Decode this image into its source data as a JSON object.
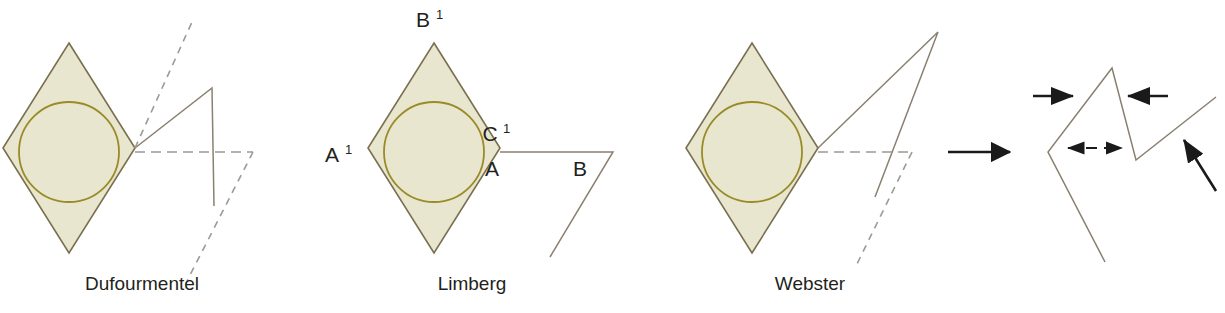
{
  "figure": {
    "background_color": "#ffffff"
  },
  "colors": {
    "lesion_fill": "#e8e6cf",
    "lesion_stroke": "#9a8b28",
    "rhombus_stroke": "#7a6f4e",
    "flap_line": "#8a8070",
    "dashed_line": "#9b9a93",
    "arrow": "#1a1a1a",
    "text": "#231f20"
  },
  "panels": [
    {
      "id": "dufourmentel",
      "caption": "Dufourmentel",
      "caption_x": 142,
      "caption_y": 290,
      "rhombus": {
        "cx": 69,
        "cy": 148,
        "rx": 66,
        "ry": 105
      },
      "circle": {
        "cx": 69,
        "cy": 152,
        "r": 50
      }
    },
    {
      "id": "limberg",
      "caption": "Limberg",
      "caption_x": 472,
      "caption_y": 290,
      "rhombus": {
        "cx": 434,
        "cy": 148,
        "rx": 66,
        "ry": 105
      },
      "circle": {
        "cx": 434,
        "cy": 152,
        "r": 50
      },
      "vertex_labels": [
        {
          "name": "B-prime",
          "text": "B",
          "sup": "1",
          "x": 423,
          "y": 27
        },
        {
          "name": "A-prime",
          "text": "A",
          "sup": "1",
          "x": 332,
          "y": 162
        },
        {
          "name": "C-prime",
          "text": "C",
          "sup": "1",
          "x": 490,
          "y": 141
        },
        {
          "name": "A",
          "text": "A",
          "sup": "",
          "x": 492,
          "y": 176
        },
        {
          "name": "B",
          "text": "B",
          "sup": "",
          "x": 580,
          "y": 176
        }
      ]
    },
    {
      "id": "webster",
      "caption": "Webster",
      "caption_x": 810,
      "caption_y": 290,
      "rhombus": {
        "cx": 752,
        "cy": 148,
        "rx": 66,
        "ry": 105
      },
      "circle": {
        "cx": 752,
        "cy": 152,
        "r": 50
      }
    },
    {
      "id": "closure",
      "caption": "",
      "caption_x": 0,
      "caption_y": 0
    }
  ],
  "arrows": [
    {
      "name": "transition-arrow",
      "direction": "right",
      "style": "solid",
      "x1": 948,
      "y1": 152,
      "x2": 1014,
      "y2": 152
    },
    {
      "name": "closure-arrow-left-top",
      "direction": "right",
      "style": "solid",
      "x1": 1033,
      "y1": 96,
      "x2": 1075,
      "y2": 96
    },
    {
      "name": "closure-arrow-right-top",
      "direction": "left",
      "style": "solid",
      "x1": 1168,
      "y1": 96,
      "x2": 1126,
      "y2": 96
    },
    {
      "name": "closure-arrow-double-dashed",
      "direction": "both",
      "style": "dashed",
      "x1": 1065,
      "y1": 148,
      "x2": 1125,
      "y2": 148
    },
    {
      "name": "closure-arrow-diagonal",
      "direction": "up-left",
      "style": "solid",
      "x1": 1215,
      "y1": 190,
      "x2": 1182,
      "y2": 138
    }
  ],
  "closure_shape": {
    "name": "closed-rhomboid-flap",
    "points": "1105,262 1048,152 1112,68 1136,160 1216,97"
  }
}
